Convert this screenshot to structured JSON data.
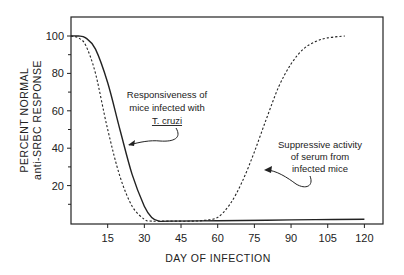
{
  "chart_data": {
    "type": "line",
    "title": "",
    "xlabel": "DAY OF INFECTION",
    "ylabel_line1": "PERCENT NORMAL",
    "ylabel_line2": "anti-SRBC RESPONSE",
    "xlim": [
      0,
      128
    ],
    "ylim": [
      0,
      110
    ],
    "xticks": [
      15,
      30,
      45,
      60,
      75,
      90,
      105,
      120
    ],
    "yticks_labeled": [
      20,
      40,
      60,
      80,
      100
    ],
    "yticks_minor": [
      10,
      30,
      50,
      70,
      90
    ],
    "grid": false,
    "legend": "none (annotations with arrows)",
    "series": [
      {
        "name": "Responsiveness of mice infected with T. cruzi",
        "style": "solid",
        "x": [
          0,
          3,
          6,
          10,
          15,
          20,
          25,
          30,
          33,
          36,
          40,
          60,
          80,
          100,
          120
        ],
        "y": [
          100,
          100,
          99,
          93,
          75,
          50,
          26,
          9,
          3,
          1,
          1,
          1.2,
          1.5,
          1.8,
          2
        ]
      },
      {
        "name": "Suppressive activity of serum from infected mice",
        "style": "dashed",
        "x": [
          0,
          3,
          6,
          10,
          15,
          20,
          25,
          30,
          33,
          40,
          50,
          55,
          60,
          65,
          70,
          75,
          80,
          85,
          90,
          95,
          100,
          105,
          112
        ],
        "y": [
          100,
          99,
          95,
          80,
          50,
          25,
          9,
          2,
          1,
          1,
          1,
          1.5,
          3,
          10,
          22,
          38,
          56,
          73,
          85,
          93,
          97,
          99,
          100
        ]
      }
    ],
    "annotations": [
      {
        "lines": [
          "Responsiveness of",
          "mice infected with"
        ],
        "italic_underlined": "T. cruzi",
        "points_to": "solid"
      },
      {
        "lines": [
          "Suppressive activity",
          "of serum from",
          "infected mice"
        ],
        "points_to": "dashed"
      }
    ]
  }
}
